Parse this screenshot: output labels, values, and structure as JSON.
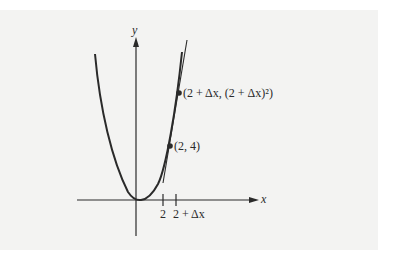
{
  "diagram": {
    "axes": {
      "x_label": "x",
      "y_label": "y"
    },
    "ticks": {
      "tick_a": "2",
      "tick_b": "2 + Δx"
    },
    "points": {
      "p1": "(2, 4)",
      "p2": "(2 + Δx, (2 + Δx)²)"
    },
    "colors": {
      "background": "#f3f3f2",
      "ink": "#2a2a2a"
    }
  }
}
